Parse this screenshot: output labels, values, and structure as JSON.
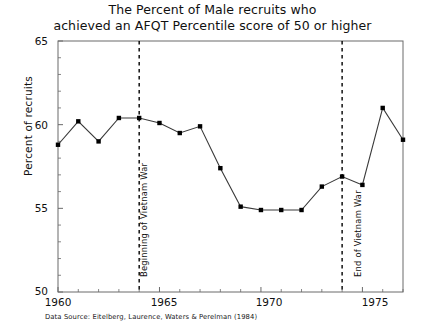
{
  "title": {
    "line1": "The Percent of Male recruits who",
    "line2": "achieved an AFQT Percentile score  of 50 or higher"
  },
  "source_note": "Data Source: Eitelberg, Laurence,  Waters & Perelman (1984)",
  "axes": {
    "ylabel": "Percent of recruits",
    "xlabel": "",
    "yticks": [
      "65",
      "60",
      "55",
      "50"
    ],
    "xticks": [
      "1960",
      "1965",
      "1970",
      "1975"
    ]
  },
  "annotations": [
    {
      "label": "Beginning of Vietnam War",
      "year": 1964
    },
    {
      "label": "End of Vietnam War",
      "year": 1974
    }
  ],
  "colors": {
    "line": "#3a3a3a",
    "marker": "#000000",
    "frame": "#5a5a5a",
    "dashed": "#000000",
    "background": "#ffffff"
  },
  "chart_data": {
    "type": "line",
    "title": "The Percent of Male recruits who achieved an AFQT Percentile score  of 50 or higher",
    "xlabel": "",
    "ylabel": "Percent of recruits",
    "xlim": [
      1960,
      1977
    ],
    "ylim": [
      50,
      65
    ],
    "yticks": [
      50,
      55,
      60,
      65
    ],
    "xticks": [
      1960,
      1965,
      1970,
      1975
    ],
    "grid": false,
    "legend": "none",
    "x": [
      1960,
      1961,
      1962,
      1963,
      1964,
      1965,
      1966,
      1967,
      1968,
      1969,
      1970,
      1971,
      1972,
      1973,
      1974,
      1975,
      1976,
      1977
    ],
    "values": [
      58.8,
      60.2,
      59.0,
      60.4,
      60.4,
      60.1,
      59.5,
      59.9,
      57.4,
      55.1,
      54.9,
      54.9,
      54.9,
      56.3,
      56.9,
      56.4,
      61.0,
      59.1
    ],
    "series": [
      {
        "name": "Percent of male recruits with AFQT percentile >= 50",
        "values": [
          58.8,
          60.2,
          59.0,
          60.4,
          60.4,
          60.1,
          59.5,
          59.9,
          57.4,
          55.1,
          54.9,
          54.9,
          54.9,
          56.3,
          56.9,
          56.4,
          61.0,
          59.1
        ]
      }
    ],
    "vlines": [
      {
        "x": 1964,
        "label": "Beginning of Vietnam War",
        "style": "dashed"
      },
      {
        "x": 1974,
        "label": "End of Vietnam War",
        "style": "dashed"
      }
    ],
    "annotations": [
      "Data Source: Eitelberg, Laurence,  Waters & Perelman (1984)"
    ]
  }
}
